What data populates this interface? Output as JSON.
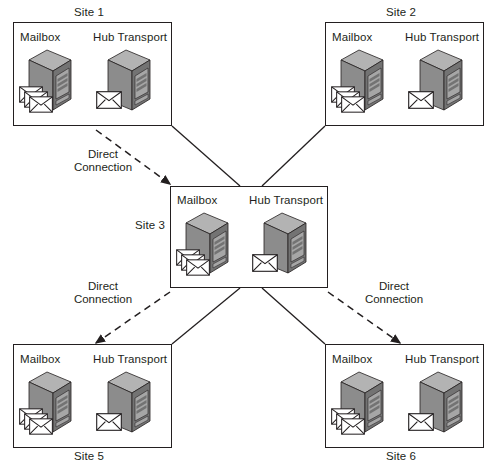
{
  "diagram": {
    "type": "network-topology",
    "roles": {
      "mailbox": "Mailbox",
      "hub_transport": "Hub Transport"
    },
    "colors": {
      "outline": "#231f20",
      "server_top": "#b3b3b3",
      "server_front": "#8c8c8c",
      "server_side": "#737373",
      "server_panel": "#a6a6a6",
      "envelope_fill": "#ffffff",
      "background": "#ffffff"
    },
    "sites": [
      {
        "id": "site1",
        "label": "Site 1",
        "label_position": "top",
        "box": {
          "x": 13,
          "y": 22,
          "w": 159,
          "h": 104
        },
        "label_pos": {
          "x": 74,
          "y": 6
        },
        "servers": [
          {
            "role": "mailbox",
            "label": "Mailbox",
            "label_pos": {
              "x": 20,
              "y": 31
            },
            "icon_pos": {
              "x": 27,
              "y": 48
            },
            "envelopes": 3
          },
          {
            "role": "hub_transport",
            "label": "Hub Transport",
            "label_pos": {
              "x": 93,
              "y": 31
            },
            "icon_pos": {
              "x": 106,
              "y": 48
            },
            "envelopes": 1
          }
        ]
      },
      {
        "id": "site2",
        "label": "Site 2",
        "label_position": "top",
        "box": {
          "x": 325,
          "y": 22,
          "w": 159,
          "h": 104
        },
        "label_pos": {
          "x": 386,
          "y": 6
        },
        "servers": [
          {
            "role": "mailbox",
            "label": "Mailbox",
            "label_pos": {
              "x": 332,
              "y": 31
            },
            "icon_pos": {
              "x": 339,
              "y": 48
            },
            "envelopes": 3
          },
          {
            "role": "hub_transport",
            "label": "Hub Transport",
            "label_pos": {
              "x": 405,
              "y": 31
            },
            "icon_pos": {
              "x": 418,
              "y": 48
            },
            "envelopes": 1
          }
        ]
      },
      {
        "id": "site3",
        "label": "Site 3",
        "label_position": "left",
        "box": {
          "x": 170,
          "y": 186,
          "w": 158,
          "h": 102
        },
        "label_pos": {
          "x": 135,
          "y": 219
        },
        "servers": [
          {
            "role": "mailbox",
            "label": "Mailbox",
            "label_pos": {
              "x": 177,
              "y": 194
            },
            "icon_pos": {
              "x": 184,
              "y": 211
            },
            "envelopes": 3
          },
          {
            "role": "hub_transport",
            "label": "Hub Transport",
            "label_pos": {
              "x": 249,
              "y": 194
            },
            "icon_pos": {
              "x": 262,
              "y": 211
            },
            "envelopes": 1
          }
        ]
      },
      {
        "id": "site5",
        "label": "Site 5",
        "label_position": "bottom",
        "box": {
          "x": 13,
          "y": 344,
          "w": 159,
          "h": 104
        },
        "label_pos": {
          "x": 74,
          "y": 450
        },
        "servers": [
          {
            "role": "mailbox",
            "label": "Mailbox",
            "label_pos": {
              "x": 20,
              "y": 353
            },
            "icon_pos": {
              "x": 27,
              "y": 370
            },
            "envelopes": 3
          },
          {
            "role": "hub_transport",
            "label": "Hub Transport",
            "label_pos": {
              "x": 93,
              "y": 353
            },
            "icon_pos": {
              "x": 106,
              "y": 370
            },
            "envelopes": 1
          }
        ]
      },
      {
        "id": "site6",
        "label": "Site 6",
        "label_position": "bottom",
        "box": {
          "x": 325,
          "y": 344,
          "w": 159,
          "h": 104
        },
        "label_pos": {
          "x": 386,
          "y": 450
        },
        "servers": [
          {
            "role": "mailbox",
            "label": "Mailbox",
            "label_pos": {
              "x": 332,
              "y": 353
            },
            "icon_pos": {
              "x": 339,
              "y": 370
            },
            "envelopes": 3
          },
          {
            "role": "hub_transport",
            "label": "Hub Transport",
            "label_pos": {
              "x": 405,
              "y": 353
            },
            "icon_pos": {
              "x": 418,
              "y": 370
            },
            "envelopes": 1
          }
        ]
      }
    ],
    "solid_links": [
      {
        "id": "link-site1-site3",
        "from": "site1",
        "to": "site3",
        "x1": 172,
        "y1": 126,
        "x2": 240,
        "y2": 186
      },
      {
        "id": "link-site2-site3",
        "from": "site2",
        "to": "site3",
        "x1": 325,
        "y1": 126,
        "x2": 262,
        "y2": 186
      },
      {
        "id": "link-site3-site5",
        "from": "site3",
        "to": "site5",
        "x1": 240,
        "y1": 288,
        "x2": 172,
        "y2": 344
      },
      {
        "id": "link-site3-site6",
        "from": "site3",
        "to": "site6",
        "x1": 262,
        "y1": 288,
        "x2": 325,
        "y2": 344
      }
    ],
    "direct_connections": [
      {
        "id": "direct-site1-site3",
        "label_line1": "Direct",
        "label_line2": "Connection",
        "label_pos": {
          "x": 103,
          "y": 148
        },
        "arrow": {
          "x1": 96,
          "y1": 130,
          "x2": 170,
          "y2": 184
        }
      },
      {
        "id": "direct-site3-site5",
        "label_line1": "Direct",
        "label_line2": "Connection",
        "label_pos": {
          "x": 103,
          "y": 280
        },
        "arrow": {
          "x1": 170,
          "y1": 292,
          "x2": 96,
          "y2": 343
        }
      },
      {
        "id": "direct-site3-site6",
        "label_line1": "Direct",
        "label_line2": "Connection",
        "label_pos": {
          "x": 394,
          "y": 280
        },
        "arrow": {
          "x1": 328,
          "y1": 292,
          "x2": 400,
          "y2": 343
        }
      }
    ]
  }
}
